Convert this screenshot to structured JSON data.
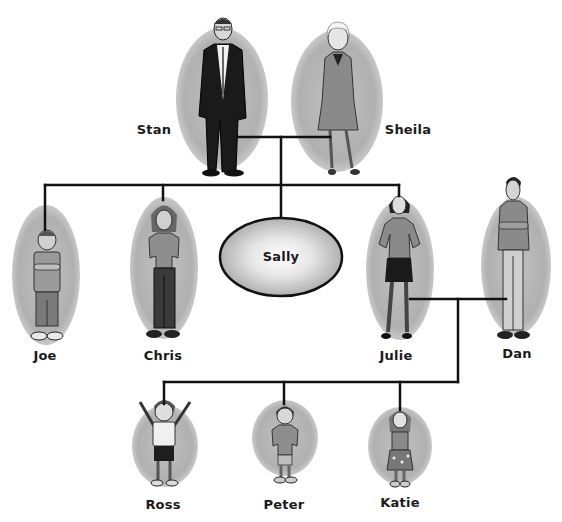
{
  "diagram": {
    "type": "family-tree",
    "colors": {
      "background": "#ffffff",
      "ellipse_fill": "#b4b4b4",
      "ellipse_fill_light": "#d9d9d9",
      "line": "#111111",
      "label": "#1a1a1a",
      "sally_center": "#ffffff",
      "sally_edge": "#a8a8a8"
    },
    "generations": [
      {
        "level": 1,
        "members": [
          {
            "id": "stan",
            "name": "Stan",
            "role": "grandfather",
            "pictured": true
          },
          {
            "id": "sheila",
            "name": "Sheila",
            "role": "grandmother",
            "pictured": true
          }
        ]
      },
      {
        "level": 2,
        "members": [
          {
            "id": "joe",
            "name": "Joe",
            "role": "son",
            "pictured": true
          },
          {
            "id": "chris",
            "name": "Chris",
            "role": "son",
            "pictured": true
          },
          {
            "id": "sally",
            "name": "Sally",
            "role": "daughter",
            "pictured": false
          },
          {
            "id": "julie",
            "name": "Julie",
            "role": "daughter",
            "pictured": true
          },
          {
            "id": "dan",
            "name": "Dan",
            "role": "son-in-law",
            "pictured": true
          }
        ]
      },
      {
        "level": 3,
        "members": [
          {
            "id": "ross",
            "name": "Ross",
            "role": "grandson",
            "pictured": true
          },
          {
            "id": "peter",
            "name": "Peter",
            "role": "grandson",
            "pictured": true
          },
          {
            "id": "katie",
            "name": "Katie",
            "role": "granddaughter",
            "pictured": true
          }
        ]
      }
    ],
    "couples": [
      {
        "partners": [
          "stan",
          "sheila"
        ],
        "children": [
          "joe",
          "chris",
          "sally",
          "julie"
        ]
      },
      {
        "partners": [
          "julie",
          "dan"
        ],
        "children": [
          "ross",
          "peter",
          "katie"
        ]
      }
    ],
    "labels": {
      "stan": "Stan",
      "sheila": "Sheila",
      "joe": "Joe",
      "chris": "Chris",
      "sally": "Sally",
      "julie": "Julie",
      "dan": "Dan",
      "ross": "Ross",
      "peter": "Peter",
      "katie": "Katie"
    }
  }
}
